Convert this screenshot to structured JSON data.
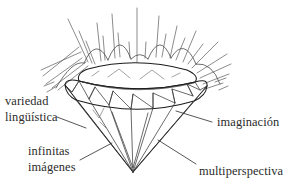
{
  "figure": {
    "background_color": "#ffffff",
    "ink_color": "#1c1c1c",
    "text_color": "#2b2b2b",
    "sparkle_color": "#5a5a5a"
  },
  "labels": {
    "variedad_line1": "variedad",
    "variedad_line2": "lingüística",
    "imaginacion": "imaginación",
    "infinitas_line1": "infinitas",
    "infinitas_line2": "imágenes",
    "multiperspectiva": "multiperspectiva"
  },
  "diagram": {
    "culet_x": 133,
    "culet_y": 172,
    "girdle_left_x": 65,
    "girdle_right_x": 207,
    "girdle_y": 97
  }
}
